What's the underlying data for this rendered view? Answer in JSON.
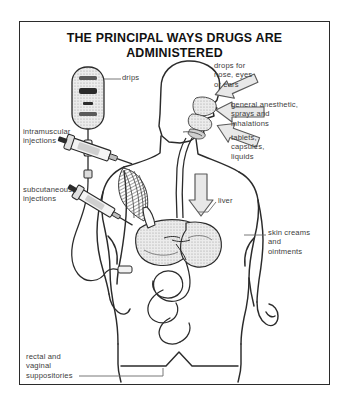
{
  "figure": {
    "title": "THE PRINCIPAL WAYS DRUGS ARE ADMINISTERED",
    "frame_color": "#2b2b2b",
    "background": "#ffffff",
    "ink_color": "#2b2b2b",
    "label_color": "#3d3d3d",
    "arrow_fill": "#e8e8e8",
    "organ_shade": "#d9d9d9"
  },
  "labels": {
    "drips": "drips",
    "intramuscular": "intramuscular\ninjections",
    "subcutaneous": "subcutaneous\ninjections",
    "rectal": "rectal and\nvaginal\nsuppositories",
    "drops": "drops for\nnose, eyes\nor ears",
    "anesthetic": "general anesthetic,\nsprays and\ninhalations",
    "tablets": "tablets,\ncapsules,\nliquids",
    "liver": "liver",
    "skin": "skin creams\nand\nointments"
  },
  "icons": {
    "iv_bag": "iv-drip-bag-icon",
    "syringe_upper": "syringe-icon",
    "syringe_lower": "syringe-icon",
    "human_body": "human-body-figure-icon",
    "head_profile": "head-profile-icon",
    "nasal_cavity": "nasal-cavity-icon",
    "esophagus": "esophagus-icon",
    "liver_organ": "liver-icon",
    "stomach_organ": "stomach-icon",
    "intestines_organ": "intestines-icon",
    "deltoid_muscle": "deltoid-muscle-hatching-icon",
    "arrow_nose": "arrow-left-icon",
    "arrow_mouth_upper": "arrow-left-icon",
    "arrow_mouth_lower": "arrow-left-icon",
    "arrow_swallow": "arrow-down-icon"
  }
}
